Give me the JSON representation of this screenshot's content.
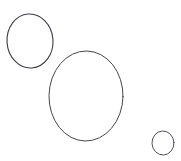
{
  "canvas": {
    "name": "ellipse-sketch-canvas",
    "width": 181,
    "height": 161,
    "background_color": "#ffffff",
    "shape_count": 3
  },
  "style": {
    "stroke_color": "#3a3a42",
    "stroke_width": 1,
    "fill": "none",
    "line_cap": "round"
  },
  "shapes": [
    {
      "id": "ellipse-top-left",
      "type": "ellipse",
      "cx": 30,
      "cy": 41,
      "rx": 23,
      "ry": 27,
      "rotation": -4,
      "stroke_color": "#3c3c45",
      "stroke_width": 1.1,
      "size_label": "medium"
    },
    {
      "id": "ellipse-center-large",
      "type": "ellipse",
      "cx": 86,
      "cy": 96,
      "rx": 37,
      "ry": 45,
      "rotation": 1,
      "stroke_color": "#45454e",
      "stroke_width": 1.0,
      "size_label": "large"
    },
    {
      "id": "ellipse-bottom-right",
      "type": "ellipse",
      "cx": 163,
      "cy": 143,
      "rx": 11,
      "ry": 12,
      "rotation": -3,
      "stroke_color": "#50505a",
      "stroke_width": 1.0,
      "size_label": "small"
    }
  ]
}
